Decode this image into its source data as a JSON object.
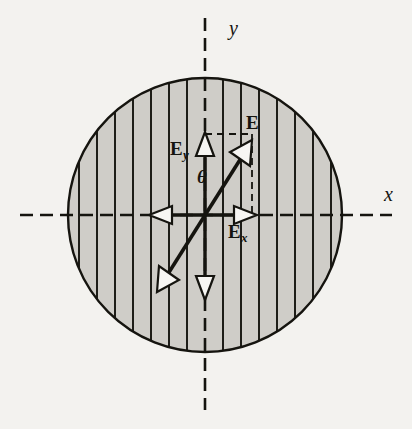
{
  "figure": {
    "background_color": "#f3f2ef",
    "ink_color": "#15140f",
    "medium_fill_color": "#cfcdc8",
    "arrow_fill_color": "#f7f6f3"
  },
  "axes": {
    "x_label": "x",
    "y_label": "y",
    "style": "dashed",
    "origin": {
      "x": 205,
      "y": 215
    },
    "x_extent": [
      20,
      392
    ],
    "y_extent": [
      18,
      410
    ]
  },
  "medium": {
    "name": "circular-hatched-region",
    "center": {
      "x": 205,
      "y": 215
    },
    "radius": 137,
    "hatch_orientation": "vertical",
    "hatch_count": 15,
    "hatch_spacing": 18
  },
  "vectors": [
    {
      "id": "E",
      "label": "E",
      "label_main": "E",
      "label_sub": "",
      "description": "resultant electric field vector, double headed",
      "tip": {
        "x": 250,
        "y": 144
      },
      "tail": {
        "x": 160,
        "y": 286
      },
      "double_headed": true,
      "angle_from_y_axis_deg": 32
    },
    {
      "id": "Ey",
      "label": "Ey",
      "label_main": "E",
      "label_sub": "y",
      "description": "y component of the field, double headed along the y axis",
      "tip": {
        "x": 205,
        "y": 144
      },
      "tail": {
        "x": 205,
        "y": 286
      },
      "double_headed": true
    },
    {
      "id": "Ex",
      "label": "Ex",
      "label_main": "E",
      "label_sub": "x",
      "description": "x component of the field, double headed along the x axis",
      "tip": {
        "x": 250,
        "y": 215
      },
      "tail": {
        "x": 160,
        "y": 215
      },
      "double_headed": true
    }
  ],
  "angle": {
    "symbol": "θ",
    "between": [
      "Ey",
      "E"
    ],
    "vertex": {
      "x": 205,
      "y": 215
    }
  },
  "construction_lines": {
    "style": "dashed",
    "segments": [
      {
        "from": {
          "x": 205,
          "y": 134
        },
        "to": {
          "x": 250,
          "y": 134
        }
      },
      {
        "from": {
          "x": 250,
          "y": 134
        },
        "to": {
          "x": 250,
          "y": 215
        }
      }
    ]
  }
}
